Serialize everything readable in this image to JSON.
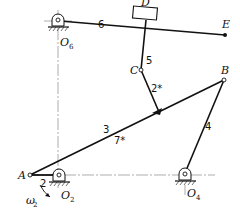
{
  "diagram": {
    "type": "planar linkage mechanism",
    "points": {
      "A": "A",
      "B": "B",
      "C": "C",
      "D": "D",
      "E": "E"
    },
    "pivots": {
      "O2": {
        "main": "O",
        "sub": "2"
      },
      "O4": {
        "main": "O",
        "sub": "4"
      },
      "O6": {
        "main": "O",
        "sub": "6"
      }
    },
    "links": {
      "link2": "2",
      "link3": "3",
      "link4": "4",
      "link5": "5",
      "link6": "6",
      "link2star": "2*",
      "link7star": "7*"
    },
    "angular_velocity": {
      "main": "ω",
      "sub": "2"
    },
    "colors": {
      "line": "#111111",
      "centerline": "#666666",
      "background": "#ffffff"
    }
  }
}
